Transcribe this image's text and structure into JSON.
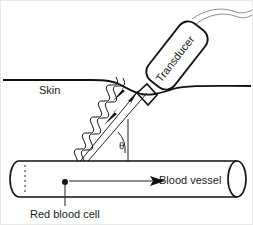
{
  "figure": {
    "background_color": "#ffffff",
    "line_color": "#111111",
    "cable_color": "#8c8c8c"
  },
  "labels": {
    "skin": "Skin",
    "transducer": "Transducer",
    "blood_vessel": "Blood vessel",
    "red_blood_cell": "Red blood cell",
    "angle": "θ"
  },
  "elements": {
    "skin_line": "skin-surface-line",
    "transducer_body": "transducer-probe",
    "transducer_cable": "transducer-cable",
    "vessel_body": "blood-vessel-cylinder",
    "vessel_left_cap": "vessel-left-end",
    "vessel_right_cap": "vessel-right-end",
    "beam_transmit": "ultrasound-transmit-beam",
    "beam_receive": "ultrasound-echo-beam",
    "wave_transmit": "transmit-waveform",
    "wave_receive": "echo-waveform",
    "flow_arrow": "blood-flow-arrow",
    "angle_arc": "doppler-angle-arc",
    "rbc_marker": "red-blood-cell-dot",
    "rbc_leader": "red-blood-cell-leader-line"
  }
}
